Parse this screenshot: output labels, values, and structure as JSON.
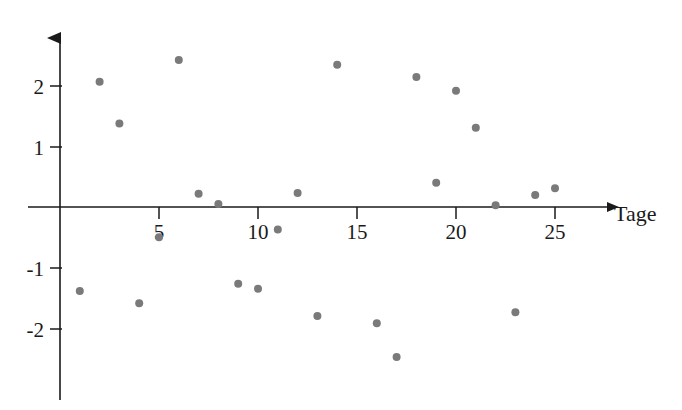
{
  "chart_data": {
    "type": "scatter",
    "title": "",
    "xlabel": "Tage",
    "ylabel": "",
    "xlim": [
      0,
      28.5
    ],
    "ylim": [
      -3.0,
      2.9
    ],
    "grid": false,
    "legend": null,
    "x_ticks": [
      5,
      10,
      15,
      20,
      25
    ],
    "x_tick_labels": [
      "5",
      "10",
      "15",
      "20",
      "25"
    ],
    "y_ticks": [
      -2,
      -1,
      1,
      2
    ],
    "y_tick_labels": [
      "-2",
      "-1",
      "1",
      "2"
    ],
    "point_color": "#7a7a7a",
    "point_radius": 4,
    "axis_color": "#1a1a1a",
    "x": [
      1,
      2,
      3,
      4,
      5,
      6,
      7,
      8,
      9,
      10,
      11,
      12,
      13,
      14,
      16,
      17,
      18,
      19,
      20,
      21,
      22,
      23,
      24,
      25
    ],
    "y": [
      -1.39,
      2.07,
      1.38,
      -1.59,
      -0.5,
      2.43,
      0.22,
      0.05,
      -1.27,
      -1.35,
      -0.37,
      0.23,
      -1.8,
      2.35,
      -1.92,
      -2.48,
      2.15,
      0.4,
      1.92,
      1.31,
      0.03,
      -1.74,
      0.2,
      0.31
    ],
    "points": [
      {
        "x": 1,
        "y": -1.39
      },
      {
        "x": 2,
        "y": 2.07
      },
      {
        "x": 3,
        "y": 1.38
      },
      {
        "x": 4,
        "y": -1.59
      },
      {
        "x": 5,
        "y": -0.5
      },
      {
        "x": 6,
        "y": 2.43
      },
      {
        "x": 7,
        "y": 0.22
      },
      {
        "x": 8,
        "y": 0.05
      },
      {
        "x": 9,
        "y": -1.27
      },
      {
        "x": 10,
        "y": -1.35
      },
      {
        "x": 11,
        "y": -0.37
      },
      {
        "x": 12,
        "y": 0.23
      },
      {
        "x": 13,
        "y": -1.8
      },
      {
        "x": 14,
        "y": 2.35
      },
      {
        "x": 16,
        "y": -1.92
      },
      {
        "x": 17,
        "y": -2.48
      },
      {
        "x": 18,
        "y": 2.15
      },
      {
        "x": 19,
        "y": 0.4
      },
      {
        "x": 20,
        "y": 1.92
      },
      {
        "x": 21,
        "y": 1.31
      },
      {
        "x": 22,
        "y": 0.03
      },
      {
        "x": 23,
        "y": -1.74
      },
      {
        "x": 24,
        "y": 0.2
      },
      {
        "x": 25,
        "y": 0.31
      }
    ]
  },
  "axes": {
    "x_axis_name": "horizontal-axis",
    "y_axis_name": "vertical-axis",
    "x_label": "Tage"
  }
}
